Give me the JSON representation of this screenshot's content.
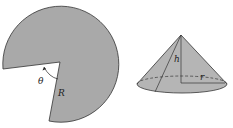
{
  "figure": {
    "sector": {
      "angle_label": "θ",
      "radius_label": "R",
      "fill_color": "#a9a9a9",
      "stroke_color": "#333333"
    },
    "cone": {
      "height_label": "h",
      "radius_label": "r",
      "fill_color": "#b5b5b5",
      "stroke_color": "#333333"
    }
  }
}
